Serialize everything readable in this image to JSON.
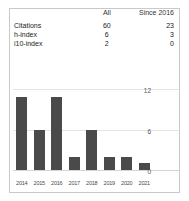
{
  "widget": {
    "name": "citation-metrics-widget"
  },
  "table": {
    "columns": [
      "",
      "All",
      "Since 2016"
    ],
    "header": {
      "label": "",
      "all": "All",
      "since": "Since 2016"
    },
    "rows": [
      {
        "label": "Citations",
        "all": "60",
        "since": "23"
      },
      {
        "label": "h-index",
        "all": "6",
        "since": "3"
      },
      {
        "label": "i10-index",
        "all": "2",
        "since": "0"
      }
    ]
  },
  "chart_data": {
    "type": "bar",
    "title": "",
    "xlabel": "",
    "ylabel": "",
    "categories": [
      "2014",
      "2015",
      "2016",
      "2017",
      "2018",
      "2019",
      "2020",
      "2021"
    ],
    "values": [
      11,
      6,
      11,
      2,
      6,
      2,
      2,
      1
    ],
    "ylim": [
      0,
      13.5
    ],
    "yticks": [
      0,
      6,
      12
    ],
    "ytick_labels": [
      "0",
      "6",
      "12"
    ],
    "grid": true,
    "legend": false,
    "bar_color": "#4a4a4a",
    "grid_color": "#e4e4e4"
  },
  "colors": {
    "border": "#c9c9c9",
    "text": "#222222",
    "muted": "#555555",
    "bar": "#4a4a4a"
  }
}
